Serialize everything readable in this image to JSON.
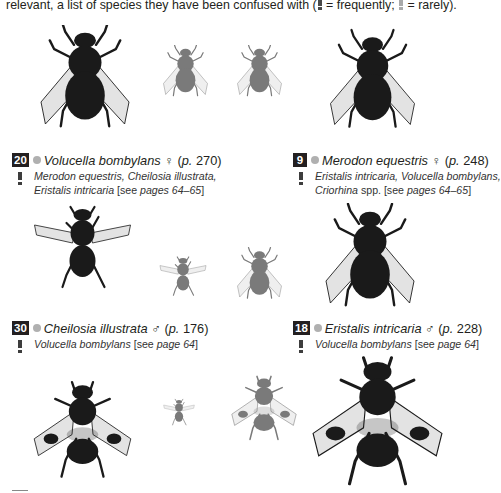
{
  "intro": {
    "text_before": "relevant, a list of species they have been confused with (",
    "freq_label": " = frequently; ",
    "rare_label": " = rarely)."
  },
  "entries": [
    {
      "badge": "20",
      "species": "Volucella bombylans",
      "sex": "♀",
      "page_prefix": "(",
      "page_p": "p.",
      "page_num": " 270)",
      "confusion_frequency": "frequently",
      "confused_line1": "Merodon equestris, Cheilosia illustrata,",
      "confused_line2_italic": "Eristalis intricaria ",
      "confused_line2_normal": "[see ",
      "confused_line2_pages": "pages 64–65",
      "confused_line2_end": "]"
    },
    {
      "badge": "9",
      "species": "Merodon equestris",
      "sex": "♀",
      "page_prefix": "(",
      "page_p": "p.",
      "page_num": " 248)",
      "confusion_frequency": "frequently",
      "confused_line1": "Eristalis intricaria, Volucella bombylans,",
      "confused_line2_italic": "Criorhina ",
      "confused_line2_normal": "spp. [see ",
      "confused_line2_pages": "pages 64–65",
      "confused_line2_end": "]"
    },
    {
      "badge": "30",
      "species": "Cheilosia illustrata",
      "sex": "♂",
      "page_prefix": "(",
      "page_p": "p.",
      "page_num": " 176)",
      "confusion_frequency": "frequently",
      "confused_line1_italic": "Volucella bombylans ",
      "confused_line1_normal": "[see ",
      "confused_line1_pages": "page 64",
      "confused_line1_end": "]"
    },
    {
      "badge": "18",
      "species": "Eristalis intricaria",
      "sex": "♂",
      "page_prefix": "(",
      "page_p": "p.",
      "page_num": " 228)",
      "confusion_frequency": "frequently",
      "confused_line1_italic": "Volucella bombylans ",
      "confused_line1_normal": "[see ",
      "confused_line1_pages": "page 64",
      "confused_line1_end": "]"
    }
  ],
  "images": [
    {
      "name": "volucella-bombylans-large",
      "tone": "dark"
    },
    {
      "name": "volucella-bombylans-small",
      "tone": "grey"
    },
    {
      "name": "merodon-equestris-small",
      "tone": "grey"
    },
    {
      "name": "merodon-equestris-large",
      "tone": "dark"
    },
    {
      "name": "cheilosia-illustrata-large",
      "tone": "dark"
    },
    {
      "name": "cheilosia-illustrata-small",
      "tone": "grey"
    },
    {
      "name": "eristalis-intricaria-small",
      "tone": "grey"
    },
    {
      "name": "eristalis-intricaria-large",
      "tone": "dark"
    },
    {
      "name": "volucella-pellucens-large",
      "tone": "dark"
    },
    {
      "name": "volucella-pellucens-tiny",
      "tone": "grey"
    },
    {
      "name": "volucella-pellucens-small",
      "tone": "grey"
    },
    {
      "name": "volucella-pellucens-xlarge",
      "tone": "dark"
    }
  ],
  "colors": {
    "badge_bg": "#231f20",
    "dot": "#b0b0b0",
    "text": "#231f20",
    "fly_dark": "#1a1a1a",
    "fly_grey": "#7a7a7a"
  }
}
